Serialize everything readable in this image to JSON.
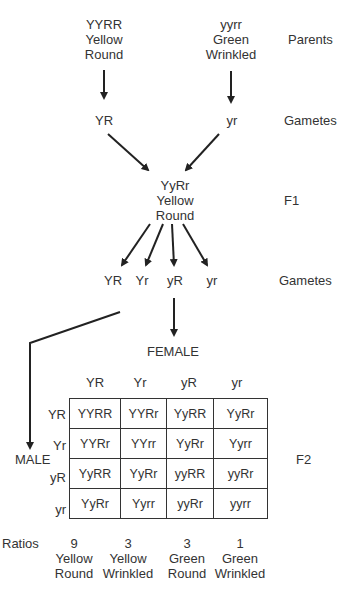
{
  "parents": {
    "left": {
      "genotype": "YYRR",
      "color": "Yellow",
      "shape": "Round"
    },
    "right": {
      "genotype": "yyrr",
      "color": "Green",
      "shape": "Wrinkled"
    },
    "label": "Parents"
  },
  "parent_gametes": {
    "left": "YR",
    "right": "yr",
    "label": "Gametes"
  },
  "f1": {
    "genotype": "YyRr",
    "color": "Yellow",
    "shape": "Round",
    "label": "F1"
  },
  "f1_gametes": {
    "items": [
      "YR",
      "Yr",
      "yR",
      "yr"
    ],
    "label": "Gametes"
  },
  "punnett": {
    "female_label": "FEMALE",
    "male_label": "MALE",
    "f2_label": "F2",
    "col_headers": [
      "YR",
      "Yr",
      "yR",
      "yr"
    ],
    "row_headers": [
      "YR",
      "Yr",
      "yR",
      "yr"
    ],
    "rows": [
      [
        "YYRR",
        "YYRr",
        "YyRR",
        "YyRr"
      ],
      [
        "YYRr",
        "YYrr",
        "YyRr",
        "Yyrr"
      ],
      [
        "YyRR",
        "YyRr",
        "yyRR",
        "yyRr"
      ],
      [
        "YyRr",
        "Yyrr",
        "yyRr",
        "yyrr"
      ]
    ]
  },
  "ratios": {
    "label": "Ratios",
    "items": [
      {
        "value": "9",
        "color": "Yellow",
        "shape": "Round"
      },
      {
        "value": "3",
        "color": "Yellow",
        "shape": "Wrinkled"
      },
      {
        "value": "3",
        "color": "Green",
        "shape": "Round"
      },
      {
        "value": "1",
        "color": "Green",
        "shape": "Wrinkled"
      }
    ]
  }
}
